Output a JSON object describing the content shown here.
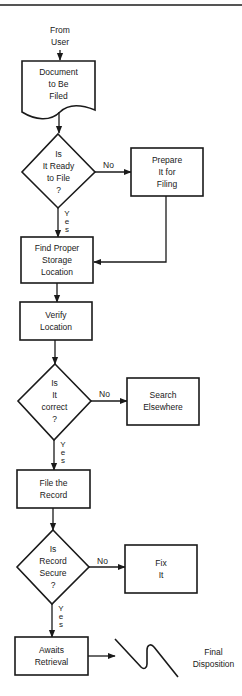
{
  "header": {
    "cut_title": "Procedures"
  },
  "diagram": {
    "start": {
      "label": "From\nUser"
    },
    "nodes": [
      {
        "id": "document",
        "type": "document",
        "label": "Document\nto Be\nFiled"
      },
      {
        "id": "ready",
        "type": "decision",
        "label": "Is\nIt Ready\nto File\n?"
      },
      {
        "id": "prepare",
        "type": "process",
        "label": "Prepare\nIt for\nFiling"
      },
      {
        "id": "find",
        "type": "process",
        "label": "Find Proper\nStorage\nLocation"
      },
      {
        "id": "verify",
        "type": "process",
        "label": "Verify\nLocation"
      },
      {
        "id": "correct",
        "type": "decision",
        "label": "Is\nIt\ncorrect\n?"
      },
      {
        "id": "search",
        "type": "process",
        "label": "Search\nElsewhere"
      },
      {
        "id": "file",
        "type": "process",
        "label": "File the\nRecord"
      },
      {
        "id": "secure",
        "type": "decision",
        "label": "Is\nRecord\nSecure\n?"
      },
      {
        "id": "fix",
        "type": "process",
        "label": "Fix\nIt"
      },
      {
        "id": "awaits",
        "type": "process",
        "label": "Awaits\nRetrieval"
      }
    ],
    "end": {
      "label": "Final\nDisposition"
    },
    "edges": [
      {
        "from": "start",
        "to": "document",
        "label": ""
      },
      {
        "from": "document",
        "to": "ready",
        "label": ""
      },
      {
        "from": "ready",
        "to": "prepare",
        "label": "No"
      },
      {
        "from": "ready",
        "to": "find",
        "label": "Yes"
      },
      {
        "from": "prepare",
        "to": "find",
        "label": ""
      },
      {
        "from": "find",
        "to": "verify",
        "label": ""
      },
      {
        "from": "verify",
        "to": "correct",
        "label": ""
      },
      {
        "from": "correct",
        "to": "search",
        "label": "No"
      },
      {
        "from": "correct",
        "to": "file",
        "label": "Yes"
      },
      {
        "from": "file",
        "to": "secure",
        "label": ""
      },
      {
        "from": "secure",
        "to": "fix",
        "label": "No"
      },
      {
        "from": "secure",
        "to": "awaits",
        "label": "Yes"
      },
      {
        "from": "awaits",
        "to": "end",
        "label": ""
      }
    ],
    "edge_labels": {
      "no": "No",
      "yes_vertical": "Y\ne\ns"
    }
  }
}
